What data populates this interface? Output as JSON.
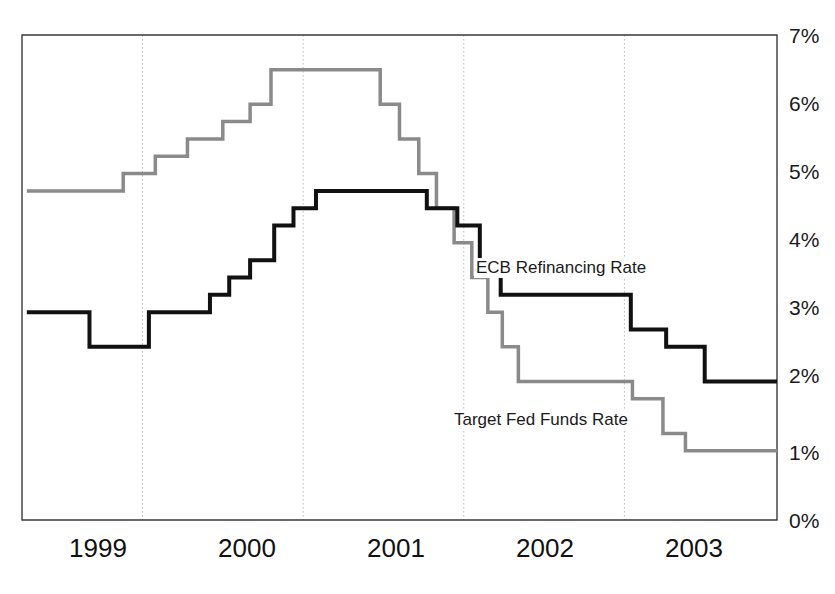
{
  "chart_data": {
    "type": "line",
    "title": "",
    "subtitle": "",
    "xlabel": "",
    "ylabel": "",
    "xlim": [
      1998.75,
      2003.45
    ],
    "ylim": [
      0,
      7
    ],
    "grid": true,
    "grid_axis": "x",
    "legend_position": "inline-annotation",
    "step_style": "post",
    "x_tick_labels": [
      "1999",
      "2000",
      "2001",
      "2002",
      "2003"
    ],
    "x_tick_positions": [
      1999,
      2000,
      2001,
      2002,
      2003
    ],
    "x_gridline_positions": [
      1999.5,
      2000.5,
      2001.5,
      2002.5
    ],
    "y_tick_labels": [
      "0%",
      "1%",
      "2%",
      "3%",
      "4%",
      "5%",
      "6%",
      "7%"
    ],
    "y_tick_values": [
      0,
      1,
      2,
      3,
      4,
      5,
      6,
      7
    ],
    "series": [
      {
        "name": "ECB Refinancing Rate",
        "color": "#111111",
        "line_width": 4,
        "annotation": "ECB Refinancing Rate",
        "points": [
          {
            "x": 1998.78,
            "y": 3.0
          },
          {
            "x": 1999.17,
            "y": 2.5
          },
          {
            "x": 1999.54,
            "y": 3.0
          },
          {
            "x": 1999.92,
            "y": 3.25
          },
          {
            "x": 2000.04,
            "y": 3.5
          },
          {
            "x": 2000.17,
            "y": 3.75
          },
          {
            "x": 2000.32,
            "y": 4.25
          },
          {
            "x": 2000.44,
            "y": 4.5
          },
          {
            "x": 2000.58,
            "y": 4.75
          },
          {
            "x": 2001.27,
            "y": 4.5
          },
          {
            "x": 2001.46,
            "y": 4.25
          },
          {
            "x": 2001.6,
            "y": 3.75
          },
          {
            "x": 2001.73,
            "y": 3.25
          },
          {
            "x": 2002.54,
            "y": 2.75
          },
          {
            "x": 2002.76,
            "y": 2.5
          },
          {
            "x": 2003.0,
            "y": 2.0
          },
          {
            "x": 2003.45,
            "y": 2.0
          }
        ]
      },
      {
        "name": "Target Fed Funds Rate",
        "color": "#8a8a8a",
        "line_width": 3.5,
        "annotation": "Target Fed Funds Rate",
        "points": [
          {
            "x": 1998.78,
            "y": 4.75
          },
          {
            "x": 1999.38,
            "y": 5.0
          },
          {
            "x": 1999.58,
            "y": 5.25
          },
          {
            "x": 1999.78,
            "y": 5.5
          },
          {
            "x": 2000.0,
            "y": 5.75
          },
          {
            "x": 2000.17,
            "y": 6.0
          },
          {
            "x": 2000.3,
            "y": 6.5
          },
          {
            "x": 2000.98,
            "y": 6.0
          },
          {
            "x": 2001.1,
            "y": 5.5
          },
          {
            "x": 2001.22,
            "y": 5.0
          },
          {
            "x": 2001.33,
            "y": 4.5
          },
          {
            "x": 2001.44,
            "y": 4.0
          },
          {
            "x": 2001.55,
            "y": 3.5
          },
          {
            "x": 2001.65,
            "y": 3.0
          },
          {
            "x": 2001.74,
            "y": 2.5
          },
          {
            "x": 2001.84,
            "y": 2.0
          },
          {
            "x": 2002.55,
            "y": 1.75
          },
          {
            "x": 2002.74,
            "y": 1.25
          },
          {
            "x": 2002.88,
            "y": 1.0
          },
          {
            "x": 2003.45,
            "y": 1.0
          }
        ]
      }
    ]
  },
  "axes": {
    "y_ticks": [
      {
        "label": "7%",
        "value": 7
      },
      {
        "label": "6%",
        "value": 6
      },
      {
        "label": "5%",
        "value": 5
      },
      {
        "label": "4%",
        "value": 4
      },
      {
        "label": "3%",
        "value": 3
      },
      {
        "label": "2%",
        "value": 2
      },
      {
        "label": "1%",
        "value": 1
      },
      {
        "label": "0%",
        "value": 0
      }
    ],
    "x_ticks": [
      {
        "label": "1999",
        "value": 1999
      },
      {
        "label": "2000",
        "value": 2000
      },
      {
        "label": "2001",
        "value": 2001
      },
      {
        "label": "2002",
        "value": 2002
      },
      {
        "label": "2003",
        "value": 2003
      }
    ]
  },
  "annotations": {
    "ecb": "ECB Refinancing Rate",
    "fed": "Target Fed Funds Rate"
  },
  "colors": {
    "ecb_line": "#111111",
    "fed_line": "#8a8a8a",
    "axis": "#3a3a3a",
    "gridline": "#bdbdbd",
    "background": "#ffffff",
    "text": "#111111"
  }
}
